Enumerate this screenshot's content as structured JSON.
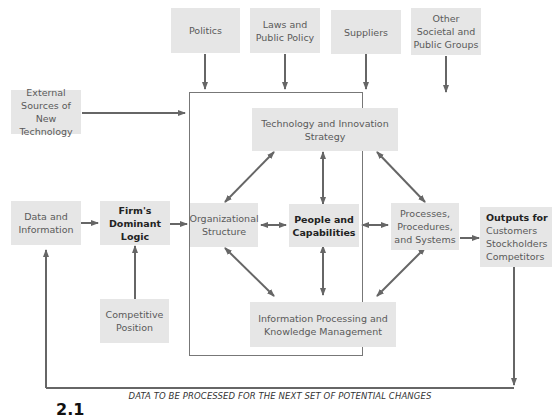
{
  "diagram": {
    "external_influences": [
      {
        "id": "politics",
        "label": "Politics"
      },
      {
        "id": "laws",
        "label": "Laws and Public Policy"
      },
      {
        "id": "suppliers",
        "label": "Suppliers"
      },
      {
        "id": "other-groups",
        "label": "Other Societal and Public Groups"
      }
    ],
    "external_tech": {
      "label": "External Sources of New Technology"
    },
    "data_info": {
      "label": "Data and Information"
    },
    "dominant_logic": {
      "label": "Firm's Dominant Logic"
    },
    "competitive_position": {
      "label": "Competitive Position"
    },
    "core": {
      "tech_strategy": {
        "label": "Technology and Innovation Strategy"
      },
      "org_structure": {
        "label": "Organizational Structure"
      },
      "people": {
        "label": "People and Capabilities"
      },
      "processes": {
        "label": "Processes, Procedures, and Systems"
      },
      "info_processing": {
        "label": "Information Processing and Knowledge Management"
      }
    },
    "outputs": {
      "title": "Outputs for",
      "items": [
        "Customers",
        "Stockholders",
        "Competitors"
      ]
    },
    "feedback_caption": "DATA TO BE PROCESSED FOR THE NEXT SET OF POTENTIAL CHANGES",
    "figure_number": "2.1"
  }
}
